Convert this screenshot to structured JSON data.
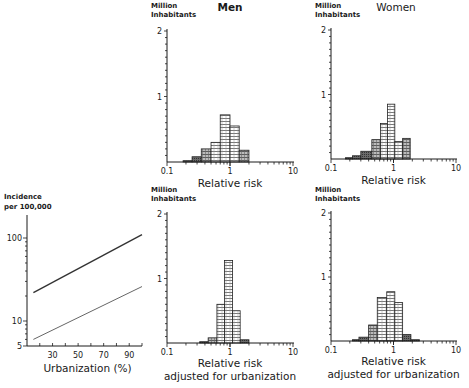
{
  "chart_data": [
    {
      "id": "incidence-vs-urbanization",
      "type": "line",
      "title": "",
      "ylabel_lines": [
        "Incidence",
        "per 100,000"
      ],
      "xlabel": "Urbanization (%)",
      "yscale": "log",
      "ylim": [
        5,
        200
      ],
      "xlim": [
        10,
        100
      ],
      "yticks": [
        5,
        10,
        100
      ],
      "ytick_labels": [
        "5",
        "10",
        "100"
      ],
      "xticks": [
        30,
        50,
        70,
        90
      ],
      "xtick_labels": [
        "30",
        "50",
        "70",
        "90"
      ],
      "series": [
        {
          "name": "Men",
          "color": "#333333",
          "x": [
            15,
            100
          ],
          "y": [
            22,
            110
          ]
        },
        {
          "name": "Women",
          "color": "#666666",
          "x": [
            15,
            100
          ],
          "y": [
            6,
            26
          ]
        }
      ],
      "grid": false
    },
    {
      "id": "men-relative-risk",
      "type": "bar",
      "title": "Men",
      "ylabel_lines": [
        "Million",
        "Inhabitants"
      ],
      "xlabel_lines": [
        "Relative risk"
      ],
      "xscale": "log",
      "xlim": [
        0.1,
        10
      ],
      "ylim": [
        0,
        2
      ],
      "yticks": [
        1,
        2
      ],
      "xtick_labels": [
        "0.1",
        "1",
        "10"
      ],
      "bins": [
        {
          "from": 0.18,
          "to": 0.25,
          "value": 0.02,
          "shade": "dark"
        },
        {
          "from": 0.25,
          "to": 0.35,
          "value": 0.08,
          "shade": "dark"
        },
        {
          "from": 0.35,
          "to": 0.5,
          "value": 0.2,
          "shade": "mid"
        },
        {
          "from": 0.5,
          "to": 0.7,
          "value": 0.3,
          "shade": "light"
        },
        {
          "from": 0.7,
          "to": 1.0,
          "value": 0.72,
          "shade": "light"
        },
        {
          "from": 1.0,
          "to": 1.4,
          "value": 0.55,
          "shade": "light"
        },
        {
          "from": 1.4,
          "to": 2.0,
          "value": 0.18,
          "shade": "mid"
        }
      ],
      "grid": false
    },
    {
      "id": "women-relative-risk",
      "type": "bar",
      "title": "Women",
      "ylabel_lines": [
        "Million",
        "Inhabitants"
      ],
      "xlabel_lines": [
        "Relative risk"
      ],
      "xscale": "log",
      "xlim": [
        0.1,
        10
      ],
      "ylim": [
        0,
        2
      ],
      "yticks": [
        1,
        2
      ],
      "xtick_labels": [
        "0.1",
        "1",
        "10"
      ],
      "bins": [
        {
          "from": 0.17,
          "to": 0.22,
          "value": 0.02,
          "shade": "dark"
        },
        {
          "from": 0.22,
          "to": 0.3,
          "value": 0.05,
          "shade": "dark"
        },
        {
          "from": 0.3,
          "to": 0.45,
          "value": 0.12,
          "shade": "dark"
        },
        {
          "from": 0.45,
          "to": 0.62,
          "value": 0.3,
          "shade": "mid"
        },
        {
          "from": 0.62,
          "to": 0.8,
          "value": 0.55,
          "shade": "light"
        },
        {
          "from": 0.8,
          "to": 1.05,
          "value": 0.85,
          "shade": "light"
        },
        {
          "from": 1.05,
          "to": 1.4,
          "value": 0.27,
          "shade": "light"
        },
        {
          "from": 1.4,
          "to": 1.85,
          "value": 0.32,
          "shade": "mid"
        }
      ],
      "grid": false
    },
    {
      "id": "men-relative-risk-adjusted",
      "type": "bar",
      "title": "",
      "ylabel_lines": [
        "Million",
        "Inhabitants"
      ],
      "xlabel_lines": [
        "Relative risk",
        "adjusted for urbanization"
      ],
      "xscale": "log",
      "xlim": [
        0.1,
        10
      ],
      "ylim": [
        0,
        2
      ],
      "yticks": [
        1,
        2
      ],
      "xtick_labels": [
        "0.1",
        "1",
        "10"
      ],
      "bins": [
        {
          "from": 0.33,
          "to": 0.45,
          "value": 0.02,
          "shade": "dark"
        },
        {
          "from": 0.45,
          "to": 0.62,
          "value": 0.08,
          "shade": "mid"
        },
        {
          "from": 0.62,
          "to": 0.82,
          "value": 0.6,
          "shade": "light"
        },
        {
          "from": 0.82,
          "to": 1.1,
          "value": 1.28,
          "shade": "light"
        },
        {
          "from": 1.1,
          "to": 1.45,
          "value": 0.5,
          "shade": "light"
        },
        {
          "from": 1.45,
          "to": 2.0,
          "value": 0.05,
          "shade": "dark"
        }
      ],
      "grid": false
    },
    {
      "id": "women-relative-risk-adjusted",
      "type": "bar",
      "title": "",
      "ylabel_lines": [
        "Million",
        "Inhabitants"
      ],
      "xlabel_lines": [
        "Relative risk",
        "adjusted for urbanization"
      ],
      "xscale": "log",
      "xlim": [
        0.1,
        10
      ],
      "ylim": [
        0,
        2
      ],
      "yticks": [
        1,
        2
      ],
      "xtick_labels": [
        "0.1",
        "1",
        "10"
      ],
      "bins": [
        {
          "from": 0.22,
          "to": 0.28,
          "value": 0.02,
          "shade": "dark"
        },
        {
          "from": 0.28,
          "to": 0.4,
          "value": 0.06,
          "shade": "dark"
        },
        {
          "from": 0.4,
          "to": 0.55,
          "value": 0.25,
          "shade": "mid"
        },
        {
          "from": 0.55,
          "to": 0.78,
          "value": 0.68,
          "shade": "light"
        },
        {
          "from": 0.78,
          "to": 1.05,
          "value": 0.77,
          "shade": "light"
        },
        {
          "from": 1.05,
          "to": 1.4,
          "value": 0.6,
          "shade": "light"
        },
        {
          "from": 1.4,
          "to": 1.9,
          "value": 0.1,
          "shade": "dark"
        },
        {
          "from": 1.9,
          "to": 2.6,
          "value": 0.02,
          "shade": "dark"
        }
      ],
      "grid": false
    }
  ],
  "labels": {
    "men_title": "Men",
    "women_title": "Women",
    "million": "Million",
    "inhabitants": "Inhabitants",
    "incidence": "Incidence",
    "per100k": "per 100,000",
    "urbanization": "Urbanization (%)",
    "relative_risk": "Relative risk",
    "adjusted": "adjusted for urbanization"
  },
  "colors": {
    "ink": "#1a1a1a",
    "dark": "#555555",
    "mid": "#8a8a8a",
    "light": "#c4c4c4"
  }
}
